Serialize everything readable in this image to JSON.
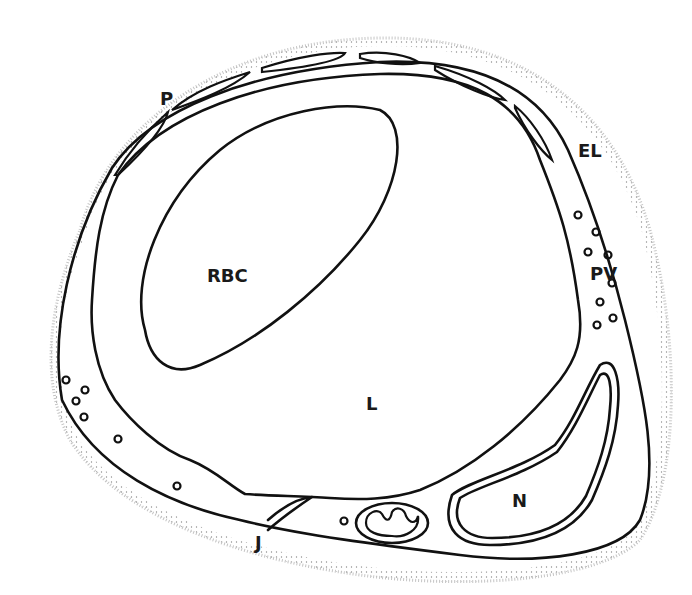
{
  "figure": {
    "colors": {
      "ink": "#111111",
      "background": "#ffffff",
      "stipple_light": "#9a9a9a",
      "stipple_dense": "#6a6a6a"
    }
  },
  "labels": {
    "pericyte": "P",
    "red_blood_cell": "RBC",
    "external_lamina": "EL",
    "pinocytotic_vesicles": "PV",
    "lumen": "L",
    "nucleus": "N",
    "junction": "J"
  }
}
